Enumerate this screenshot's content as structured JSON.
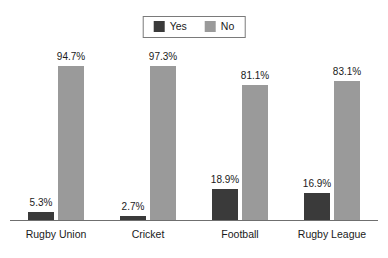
{
  "legend": {
    "position": "top-center",
    "entries": [
      {
        "label": "Yes",
        "color": "#3a3a3a",
        "icon": "square-swatch-icon"
      },
      {
        "label": "No",
        "color": "#9a9a9a",
        "icon": "square-swatch-icon"
      }
    ]
  },
  "chart_data": {
    "type": "bar",
    "title": "",
    "subtitle": "",
    "xlabel": "",
    "ylabel": "",
    "ylim": [
      0,
      100
    ],
    "grid": false,
    "legend_position": "top-center",
    "value_suffix": "%",
    "categories": [
      "Rugby Union",
      "Cricket",
      "Football",
      "Rugby League"
    ],
    "series": [
      {
        "name": "Yes",
        "color": "#3a3a3a",
        "values": [
          5.3,
          2.7,
          18.9,
          16.9
        ],
        "labels": [
          "5.3%",
          "2.7%",
          "18.9%",
          "16.9%"
        ]
      },
      {
        "name": "No",
        "color": "#9a9a9a",
        "values": [
          94.7,
          97.3,
          81.1,
          83.1
        ],
        "labels": [
          "94.7%",
          "97.3%",
          "81.1%",
          "83.1%"
        ]
      }
    ]
  }
}
